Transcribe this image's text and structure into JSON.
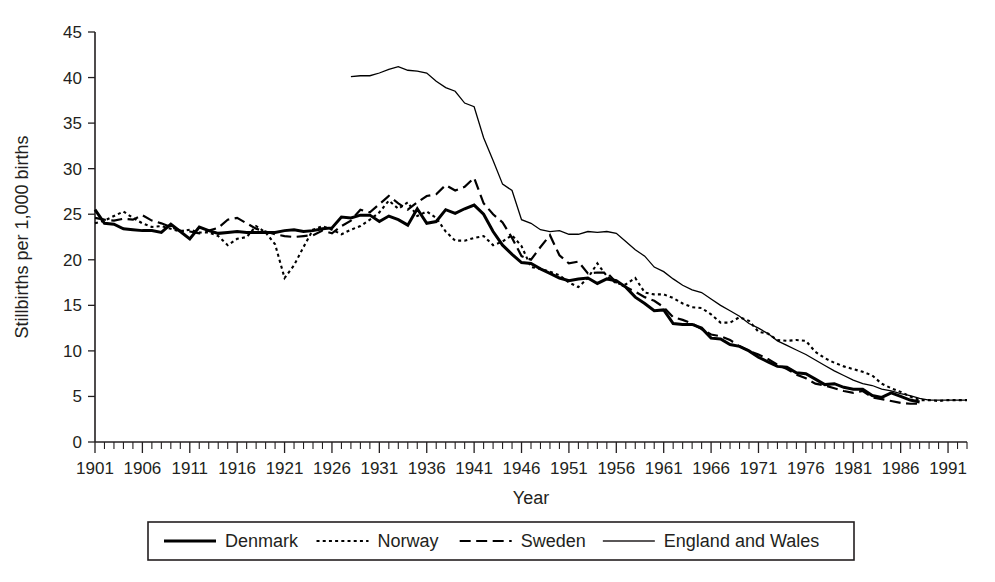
{
  "chart_data": {
    "type": "line",
    "title": "",
    "xlabel": "Year",
    "ylabel": "Stillbirths per 1,000 births",
    "xlim": [
      1901,
      1993
    ],
    "ylim": [
      0,
      45
    ],
    "ytick_step": 5,
    "yticks": [
      0,
      5,
      10,
      15,
      20,
      25,
      30,
      35,
      40,
      45
    ],
    "xticks": [
      1901,
      1906,
      1911,
      1916,
      1921,
      1926,
      1931,
      1936,
      1941,
      1946,
      1951,
      1956,
      1961,
      1966,
      1971,
      1976,
      1981,
      1986,
      1991
    ],
    "xtick_minor_step": 1,
    "grid": false,
    "legend_position": "below",
    "series": [
      {
        "name": "Denmark",
        "style": "solid-thick",
        "stroke_width": 3.0,
        "dash": "none",
        "color": "#000000",
        "x_start": 1901,
        "values": [
          25.5,
          24.0,
          23.9,
          23.4,
          23.3,
          23.2,
          23.2,
          23.0,
          23.9,
          23.1,
          22.3,
          23.6,
          23.2,
          22.9,
          23.0,
          23.1,
          23.0,
          23.0,
          23.0,
          23.0,
          23.2,
          23.3,
          23.1,
          23.2,
          23.4,
          23.5,
          24.7,
          24.6,
          24.9,
          24.9,
          24.2,
          24.8,
          24.4,
          23.8,
          25.6,
          24.0,
          24.2,
          25.5,
          25.1,
          25.6,
          26.0,
          25.0,
          23.1,
          21.6,
          20.6,
          19.7,
          19.6,
          19.0,
          18.5,
          18.0,
          17.7,
          17.9,
          18.0,
          17.4,
          17.9,
          17.7,
          17.0,
          15.9,
          15.2,
          14.4,
          14.5,
          13.0,
          12.9,
          12.9,
          12.5,
          11.4,
          11.3,
          10.7,
          10.5,
          10.0,
          9.3,
          8.8,
          8.3,
          8.2,
          7.6,
          7.5,
          6.9,
          6.3,
          6.4,
          6.0,
          5.8,
          5.8,
          5.1,
          4.9,
          5.4,
          5.0,
          4.6,
          4.4
        ]
      },
      {
        "name": "Norway",
        "style": "dotted",
        "stroke_width": 2.1,
        "dash": "3,3.2",
        "color": "#000000",
        "x_start": 1901,
        "values": [
          24.0,
          24.3,
          24.8,
          25.3,
          24.6,
          24.0,
          23.6,
          23.7,
          23.4,
          23.1,
          23.3,
          23.0,
          23.0,
          22.6,
          21.6,
          22.3,
          22.5,
          23.7,
          23.0,
          21.7,
          18.0,
          19.4,
          21.4,
          23.3,
          23.7,
          23.3,
          22.8,
          23.3,
          23.7,
          24.4,
          25.2,
          26.5,
          25.6,
          26.3,
          24.8,
          25.3,
          24.6,
          23.1,
          22.1,
          22.1,
          22.4,
          22.6,
          21.6,
          22.0,
          22.7,
          21.5,
          19.2,
          19.0,
          18.7,
          18.3,
          17.5,
          17.0,
          18.0,
          19.6,
          18.2,
          17.4,
          17.3,
          18.0,
          16.4,
          16.2,
          16.2,
          15.8,
          15.2,
          14.8,
          14.7,
          14.0,
          13.1,
          13.1,
          13.7,
          13.3,
          12.1,
          11.9,
          11.2,
          11.1,
          11.2,
          11.1,
          9.9,
          9.2,
          8.7,
          8.3,
          8.0,
          7.7,
          7.3,
          6.4,
          5.9,
          5.5,
          5.0,
          4.6,
          4.6,
          4.5,
          4.6,
          4.6,
          4.6
        ]
      },
      {
        "name": "Sweden",
        "style": "dashed",
        "stroke_width": 2.2,
        "dash": "11,5.5",
        "color": "#000000",
        "x_start": 1901,
        "values": [
          24.6,
          24.4,
          24.3,
          24.5,
          24.4,
          24.9,
          24.3,
          24.0,
          23.6,
          23.2,
          23.1,
          22.9,
          23.2,
          23.5,
          24.4,
          24.6,
          24.0,
          23.4,
          23.1,
          22.8,
          22.6,
          22.5,
          22.6,
          22.7,
          23.2,
          22.9,
          23.7,
          24.3,
          25.5,
          25.2,
          26.1,
          27.0,
          26.2,
          25.5,
          26.3,
          27.0,
          27.2,
          28.2,
          27.6,
          28.0,
          29.0,
          26.2,
          25.0,
          24.1,
          22.4,
          20.4,
          20.0,
          21.4,
          22.7,
          20.5,
          19.6,
          19.8,
          18.5,
          18.6,
          18.6,
          17.5,
          17.0,
          16.5,
          15.9,
          15.5,
          14.8,
          13.7,
          13.4,
          13.0,
          12.4,
          11.8,
          11.6,
          11.2,
          10.5,
          10.0,
          9.6,
          9.1,
          8.5,
          8.0,
          7.4,
          7.0,
          6.4,
          6.2,
          5.9,
          5.6,
          5.4,
          5.6,
          4.9,
          4.7,
          4.5,
          4.3,
          4.2,
          4.2
        ]
      },
      {
        "name": "England and Wales",
        "style": "solid-thin",
        "stroke_width": 1.3,
        "dash": "none",
        "color": "#231f20",
        "x_start": 1928,
        "values": [
          40.1,
          40.2,
          40.2,
          40.5,
          40.9,
          41.2,
          40.8,
          40.7,
          40.5,
          39.6,
          38.9,
          38.5,
          37.2,
          36.8,
          33.4,
          30.9,
          28.3,
          27.6,
          24.4,
          24.0,
          23.3,
          23.1,
          23.2,
          22.8,
          22.8,
          23.1,
          23.0,
          23.1,
          22.9,
          22.0,
          21.1,
          20.4,
          19.2,
          18.7,
          17.9,
          17.2,
          16.7,
          16.4,
          15.7,
          15.0,
          14.4,
          13.8,
          13.0,
          12.5,
          11.9,
          11.1,
          10.6,
          10.1,
          9.6,
          9.0,
          8.4,
          7.8,
          7.3,
          6.8,
          6.4,
          6.2,
          5.8,
          5.6,
          5.3,
          5.1,
          4.8,
          4.6,
          4.6,
          4.6,
          4.6,
          4.6
        ]
      }
    ]
  },
  "legend": {
    "items": [
      {
        "label": "Denmark",
        "swatch": "solid-thick"
      },
      {
        "label": "Norway",
        "swatch": "dotted"
      },
      {
        "label": "Sweden",
        "swatch": "dashed"
      },
      {
        "label": "England and Wales",
        "swatch": "solid-thin"
      }
    ]
  },
  "axes": {
    "x_title": "Year",
    "y_title": "Stillbirths per 1,000 births"
  }
}
